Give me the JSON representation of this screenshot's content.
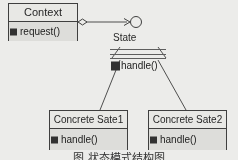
{
  "diagram": {
    "type": "uml-class-diagram",
    "pattern": "State",
    "background_color": "#f2f2ef",
    "line_color": "#3a3a3a",
    "fill_color": "#e8e8e4",
    "marker_color": "#2b2b2b"
  },
  "classes": {
    "context": {
      "name": "Context",
      "members": [
        {
          "visibility_marker": "filled-square",
          "signature": "request()"
        }
      ]
    },
    "state": {
      "name": "State",
      "render_style": "faded-partial-box",
      "members": [
        {
          "visibility_marker": "filled-square",
          "signature": "handle()"
        }
      ]
    },
    "concrete_state_1": {
      "name": "Concrete Sate1",
      "members": [
        {
          "visibility_marker": "filled-square",
          "signature": "handle()"
        }
      ]
    },
    "concrete_state_2": {
      "name": "Concrete Sate2",
      "members": [
        {
          "visibility_marker": "filled-square",
          "signature": "handle()"
        }
      ]
    }
  },
  "labels": {
    "state_interface": "State"
  },
  "connectors": [
    {
      "id": "context-to-state",
      "kind": "aggregation-with-navigable-arrow",
      "source_decoration": "hollow-diamond",
      "target_decoration": "open-arrow-to-circle"
    },
    {
      "id": "state-to-concrete1",
      "kind": "generalization",
      "source_decoration": "hollow-triangle"
    },
    {
      "id": "state-to-concrete2",
      "kind": "generalization",
      "source_decoration": "hollow-triangle"
    }
  ],
  "caption": {
    "text": "图 状态模式结构图",
    "clipped": true
  }
}
